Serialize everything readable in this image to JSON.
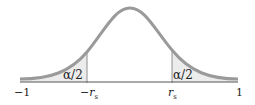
{
  "diagram": {
    "type": "bell-curve-two-tailed",
    "colors": {
      "curve": "#9a9a9a",
      "shade": "#ececec",
      "axis": "#555555",
      "text": "#222222"
    },
    "tail_labels": {
      "left": "α/2",
      "right": "α/2"
    },
    "axis_labels": {
      "min": "−1",
      "left_crit": "−r",
      "left_crit_sub": "s",
      "right_crit": "r",
      "right_crit_sub": "s",
      "max": "1"
    }
  }
}
